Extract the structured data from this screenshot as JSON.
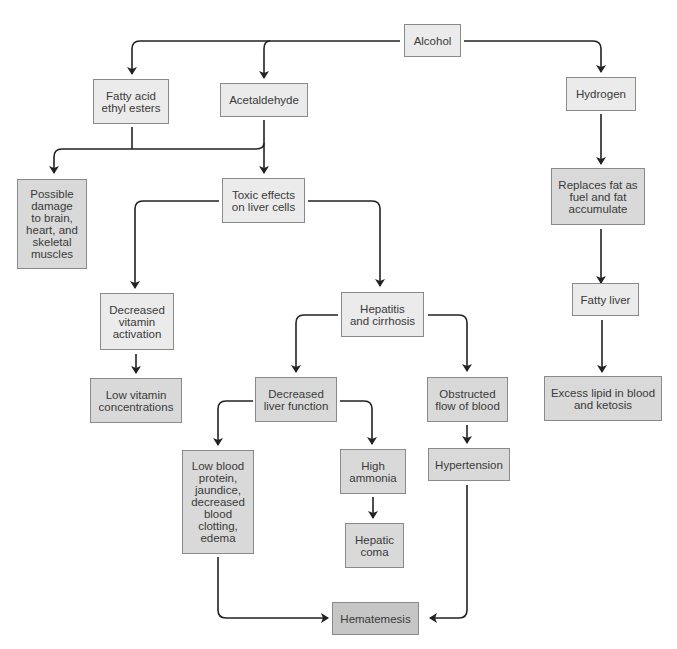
{
  "diagram": {
    "nodes": {
      "alcohol": "Alcohol",
      "fatty_acid": "Fatty acid\nethyl esters",
      "acetaldehyde": "Acetaldehyde",
      "hydrogen": "Hydrogen",
      "possible_damage": "Possible\ndamage\nto brain,\nheart, and\nskeletal\nmuscles",
      "toxic_effects": "Toxic effects\non liver cells",
      "replaces_fat": "Replaces fat as\nfuel and fat\naccumulate",
      "decreased_vitamin": "Decreased\nvitamin\nactivation",
      "hepatitis": "Hepatitis\nand cirrhosis",
      "fatty_liver": "Fatty liver",
      "low_vitamin": "Low vitamin\nconcentrations",
      "decreased_liver": "Decreased\nliver function",
      "obstructed": "Obstructed\nflow of blood",
      "excess_lipid": "Excess lipid in blood\nand ketosis",
      "low_blood_protein": "Low blood\nprotein,\njaundice,\ndecreased\nblood\nclotting,\nedema",
      "high_ammonia": "High\nammonia",
      "hypertension": "Hypertension",
      "hepatic_coma": "Hepatic\ncoma",
      "hematemesis": "Hematemesis"
    },
    "colors": {
      "level1": "#ebebeb",
      "level2": "#d9d9d9",
      "level3": "#c6c6c6",
      "line": "#222222"
    }
  }
}
